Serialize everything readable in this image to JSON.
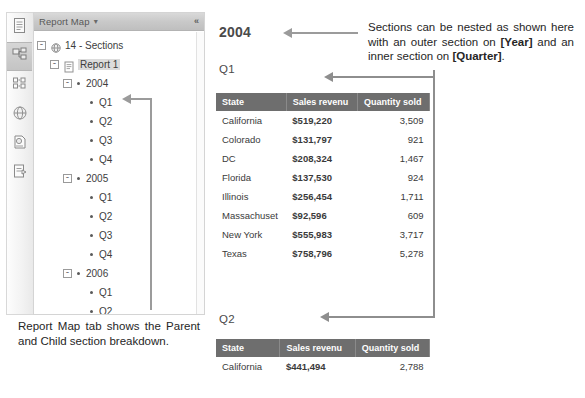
{
  "toolbar": {
    "items": [
      {
        "name": "document-icon",
        "label": "Document"
      },
      {
        "name": "report-map-icon",
        "label": "Report Map",
        "selected": true
      },
      {
        "name": "input-controls-icon",
        "label": "Input Controls"
      },
      {
        "name": "web-service-icon",
        "label": "Web Service"
      },
      {
        "name": "data-summary-icon",
        "label": "Data Summary"
      },
      {
        "name": "edit-report-icon",
        "label": "Edit Report"
      }
    ]
  },
  "panel": {
    "title": "Report Map",
    "caret": "▾",
    "collapse": "«"
  },
  "tree": {
    "nodes": [
      {
        "label": "14 - Sections",
        "depth": 0,
        "toggle": "-",
        "icon": "globe-icon",
        "selected": false
      },
      {
        "label": "Report 1",
        "depth": 1,
        "toggle": "-",
        "icon": "report-icon",
        "selected": true
      },
      {
        "label": "2004",
        "depth": 2,
        "toggle": "-",
        "icon": "bullet",
        "selected": false
      },
      {
        "label": "Q1",
        "depth": 3,
        "toggle": "",
        "icon": "bullet",
        "selected": false
      },
      {
        "label": "Q2",
        "depth": 3,
        "toggle": "",
        "icon": "bullet",
        "selected": false
      },
      {
        "label": "Q3",
        "depth": 3,
        "toggle": "",
        "icon": "bullet",
        "selected": false
      },
      {
        "label": "Q4",
        "depth": 3,
        "toggle": "",
        "icon": "bullet",
        "selected": false
      },
      {
        "label": "2005",
        "depth": 2,
        "toggle": "-",
        "icon": "bullet",
        "selected": false
      },
      {
        "label": "Q1",
        "depth": 3,
        "toggle": "",
        "icon": "bullet",
        "selected": false
      },
      {
        "label": "Q2",
        "depth": 3,
        "toggle": "",
        "icon": "bullet",
        "selected": false
      },
      {
        "label": "Q3",
        "depth": 3,
        "toggle": "",
        "icon": "bullet",
        "selected": false
      },
      {
        "label": "Q4",
        "depth": 3,
        "toggle": "",
        "icon": "bullet",
        "selected": false
      },
      {
        "label": "2006",
        "depth": 2,
        "toggle": "-",
        "icon": "bullet",
        "selected": false
      },
      {
        "label": "Q1",
        "depth": 3,
        "toggle": "",
        "icon": "bullet",
        "selected": false
      },
      {
        "label": "Q2",
        "depth": 3,
        "toggle": "",
        "icon": "bullet",
        "selected": false
      },
      {
        "label": "Q3",
        "depth": 3,
        "toggle": "",
        "icon": "bullet",
        "selected": false
      },
      {
        "label": "Q4",
        "depth": 3,
        "toggle": "",
        "icon": "bullet",
        "selected": false
      }
    ]
  },
  "caption": "Report Map tab shows the Parent and Child section breakdown.",
  "annotation": {
    "part1": "Sections can be nested as shown here with an outer section on ",
    "bold1": "[Year]",
    "part2": " and an inner section on ",
    "bold2": "[Quarter]",
    "part3": "."
  },
  "report": {
    "year_heading": "2004",
    "q1_heading": "Q1",
    "q2_heading": "Q2",
    "columns": [
      "State",
      "Sales revenu",
      "Quantity sold"
    ],
    "q1_rows": [
      {
        "state": "California",
        "revenue": "$519,220",
        "qty": "3,509"
      },
      {
        "state": "Colorado",
        "revenue": "$131,797",
        "qty": "921"
      },
      {
        "state": "DC",
        "revenue": "$208,324",
        "qty": "1,467"
      },
      {
        "state": "Florida",
        "revenue": "$137,530",
        "qty": "924"
      },
      {
        "state": "Illinois",
        "revenue": "$256,454",
        "qty": "1,711"
      },
      {
        "state": "Massachuset",
        "revenue": "$92,596",
        "qty": "609"
      },
      {
        "state": "New York",
        "revenue": "$555,983",
        "qty": "3,717"
      },
      {
        "state": "Texas",
        "revenue": "$758,796",
        "qty": "5,278"
      }
    ],
    "q2_rows": [
      {
        "state": "California",
        "revenue": "$441,494",
        "qty": "2,788"
      }
    ]
  },
  "colors": {
    "table_header_bg": "#6e6e6e",
    "arrow": "#9b9b9b",
    "selection": "#dcdcdc"
  }
}
